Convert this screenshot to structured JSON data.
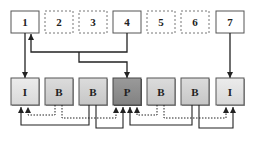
{
  "diagram": {
    "top_row": [
      {
        "label": "1",
        "style": "solid"
      },
      {
        "label": "2",
        "style": "dashed"
      },
      {
        "label": "3",
        "style": "dashed"
      },
      {
        "label": "4",
        "style": "solid"
      },
      {
        "label": "5",
        "style": "dashed"
      },
      {
        "label": "6",
        "style": "dashed"
      },
      {
        "label": "7",
        "style": "solid"
      }
    ],
    "bottom_row": [
      {
        "label": "I",
        "color": "#e2e2e2"
      },
      {
        "label": "B",
        "color": "#d2d2d2"
      },
      {
        "label": "B",
        "color": "#d2d2d2"
      },
      {
        "label": "P",
        "color": "#8e8e8e"
      },
      {
        "label": "B",
        "color": "#d2d2d2"
      },
      {
        "label": "B",
        "color": "#d2d2d2"
      },
      {
        "label": "I",
        "color": "#e2e2e2"
      }
    ],
    "colors": {
      "line": "#222222",
      "box_border": "#555555",
      "dashed_border": "#777777",
      "background": "#ffffff"
    }
  }
}
